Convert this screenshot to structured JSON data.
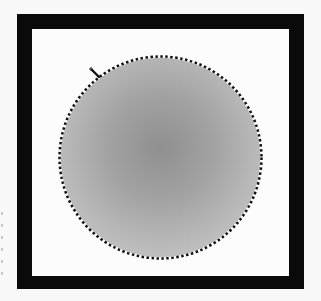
{
  "canvas": {
    "frame_color": "#0a0a0a",
    "background_color": "#fcfcfc",
    "selection": {
      "shape": "ellipse",
      "fill": "radial gray gradient",
      "outline": "marching-ants"
    },
    "cursor": {
      "icon": "elliptical-marquee-crosshair-icon"
    }
  }
}
